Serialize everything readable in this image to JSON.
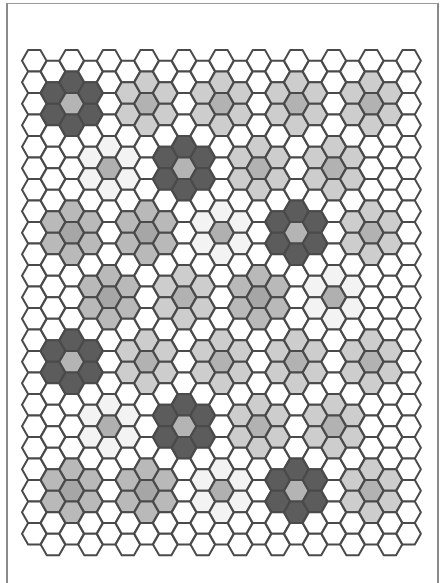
{
  "diagram": {
    "title": "",
    "type": "hexagon-grid",
    "orientation": "flat-top",
    "columns": 21,
    "rows": 23,
    "origin": {
      "x": 22,
      "y": 50
    },
    "hex_width": 24.5,
    "hex_height": 21.5,
    "column_spacing": 18.72,
    "row_spacing": 21.5,
    "odd_column_offset": 10.75,
    "colors": {
      "empty": "#ffffff",
      "stroke": "#4a4a4a",
      "dark_ring": "#5c5c5c",
      "dark_center": "#b4b4b4",
      "light_ring": "#cdcdcd",
      "light_center": "#b2b2b2",
      "medium_ring": "#b9b9b9",
      "medium_center": "#a6a6a6",
      "faint_ring": "#f3f3f3",
      "faint_center": "#b0b0b0"
    },
    "clusters": [
      {
        "col": 2,
        "row": 2,
        "type": "dark"
      },
      {
        "col": 6,
        "row": 2,
        "type": "light"
      },
      {
        "col": 10,
        "row": 2,
        "type": "light"
      },
      {
        "col": 14,
        "row": 2,
        "type": "light"
      },
      {
        "col": 18,
        "row": 2,
        "type": "light"
      },
      {
        "col": 4,
        "row": 5,
        "type": "faint"
      },
      {
        "col": 8,
        "row": 5,
        "type": "dark"
      },
      {
        "col": 12,
        "row": 5,
        "type": "light"
      },
      {
        "col": 16,
        "row": 5,
        "type": "light"
      },
      {
        "col": 2,
        "row": 8,
        "type": "medium"
      },
      {
        "col": 6,
        "row": 8,
        "type": "medium"
      },
      {
        "col": 10,
        "row": 8,
        "type": "faint"
      },
      {
        "col": 14,
        "row": 8,
        "type": "dark"
      },
      {
        "col": 18,
        "row": 8,
        "type": "light"
      },
      {
        "col": 4,
        "row": 11,
        "type": "medium"
      },
      {
        "col": 8,
        "row": 11,
        "type": "light"
      },
      {
        "col": 12,
        "row": 11,
        "type": "medium"
      },
      {
        "col": 16,
        "row": 11,
        "type": "faint"
      },
      {
        "col": 2,
        "row": 14,
        "type": "dark"
      },
      {
        "col": 6,
        "row": 14,
        "type": "light"
      },
      {
        "col": 10,
        "row": 14,
        "type": "light"
      },
      {
        "col": 14,
        "row": 14,
        "type": "light"
      },
      {
        "col": 18,
        "row": 14,
        "type": "light"
      },
      {
        "col": 4,
        "row": 17,
        "type": "faint"
      },
      {
        "col": 8,
        "row": 17,
        "type": "dark"
      },
      {
        "col": 12,
        "row": 17,
        "type": "light"
      },
      {
        "col": 16,
        "row": 17,
        "type": "light"
      },
      {
        "col": 2,
        "row": 20,
        "type": "medium"
      },
      {
        "col": 6,
        "row": 20,
        "type": "medium"
      },
      {
        "col": 10,
        "row": 20,
        "type": "faint"
      },
      {
        "col": 14,
        "row": 20,
        "type": "dark"
      },
      {
        "col": 18,
        "row": 20,
        "type": "light"
      }
    ]
  }
}
